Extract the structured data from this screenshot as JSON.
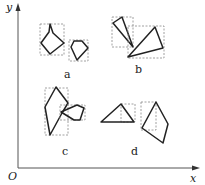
{
  "axes": {
    "x_label": "x",
    "y_label": "y",
    "origin_label": "O",
    "color": "#555555"
  },
  "groups": [
    {
      "label": "a",
      "description": "two polygons each enclosed in a dashed bounding box, boxes separate"
    },
    {
      "label": "b",
      "description": "two triangles with overlapping dashed bounding boxes"
    },
    {
      "label": "c",
      "description": "two polygons whose dashed bounding boxes overlap and shapes touch"
    },
    {
      "label": "d",
      "description": "triangle and quadrilateral with dashed bounding boxes, boxes separate"
    }
  ],
  "colors": {
    "shape_stroke": "#222222",
    "box_stroke": "#888888",
    "background": "#ffffff"
  }
}
